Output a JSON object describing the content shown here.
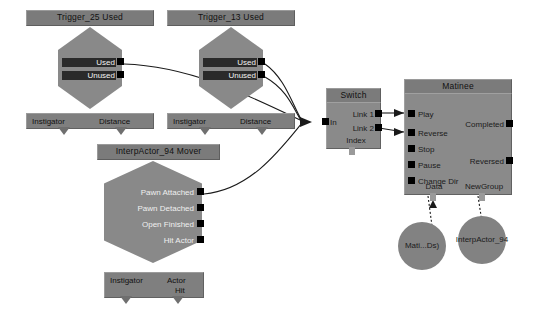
{
  "editor": {
    "name": "kismet-sequence-editor",
    "background": "#ffffff"
  },
  "palette": {
    "node_body": "#8a8a8a",
    "node_title": "#7b7b7b",
    "hex_body": "#898989",
    "var_bar": "#7f7f7f",
    "port": "#000000",
    "wire": "#1a1a1a",
    "variable_circle": "#828282"
  },
  "nodes": [
    {
      "id": "trigger25",
      "shape": "hexagon",
      "title": "Trigger_25 Used",
      "outputs": [
        "Used",
        "Unused"
      ],
      "variables": [
        "Instigator",
        "Distance"
      ]
    },
    {
      "id": "trigger13",
      "shape": "hexagon",
      "title": "Trigger_13 Used",
      "outputs": [
        "Used",
        "Unused"
      ],
      "variables": [
        "Instigator",
        "Distance"
      ]
    },
    {
      "id": "interpactor",
      "shape": "hexagon",
      "title": "InterpActor_94 Mover",
      "outputs": [
        "Pawn Attached",
        "Pawn Detached",
        "Open Finished",
        "Hit Actor"
      ],
      "variables": [
        "Instigator",
        "Actor",
        "Hit"
      ]
    },
    {
      "id": "switch",
      "shape": "box",
      "title": "Switch",
      "inputs": [
        "In"
      ],
      "outputs": [
        "Link 1",
        "Link 2"
      ],
      "variables": [
        "Index"
      ]
    },
    {
      "id": "matinee",
      "shape": "box",
      "title": "Matinee",
      "inputs": [
        "Play",
        "Reverse",
        "Stop",
        "Pause",
        "Change Dir"
      ],
      "outputs": [
        "Completed",
        "Reversed"
      ],
      "variables": [
        "Data",
        "NewGroup"
      ]
    }
  ],
  "variable_nodes": [
    {
      "id": "matinee-data-var",
      "label": "Mati...Ds)"
    },
    {
      "id": "newgroup-var",
      "label": "InterpActor_94"
    }
  ]
}
